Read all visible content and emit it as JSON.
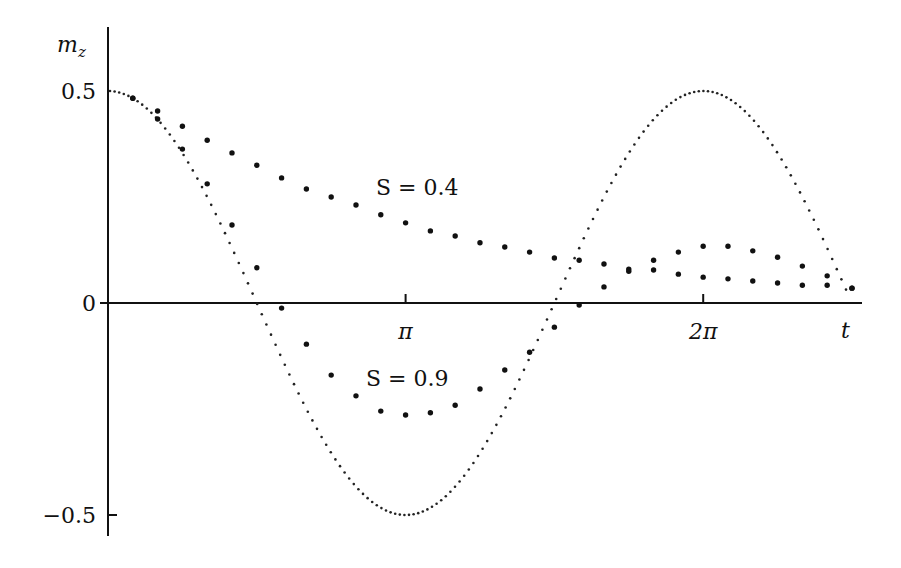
{
  "chart_data": {
    "type": "scatter",
    "title": "",
    "xlabel": "t",
    "ylabel": "m_z",
    "ylabel_main": "m",
    "ylabel_sub": "z",
    "x_ticks": [
      {
        "label": "π",
        "value_pi": 1
      },
      {
        "label": "2π",
        "value_pi": 2
      }
    ],
    "y_ticks": [
      {
        "label": "0.5",
        "value": 0.5
      },
      {
        "label": "0",
        "value": 0
      },
      {
        "label": "−0.5",
        "value": -0.5
      }
    ],
    "xlim_pi": [
      0,
      2.53
    ],
    "ylim": [
      -0.55,
      0.65
    ],
    "grid": false,
    "legend": "none (inline annotations)",
    "annotations": [
      {
        "text": "S = 0.4",
        "x_pi": 1.1,
        "y": 0.27
      },
      {
        "text": "S = 0.9",
        "x_pi": 1.0,
        "y": -0.18
      }
    ],
    "dt_pi": 0.08333,
    "series": [
      {
        "name": "reference 0.5·cos(t)",
        "style": "small dotted curve",
        "formula": "0.5*cos(t)",
        "t_range_pi": [
          0,
          2.48
        ]
      },
      {
        "name": "S = 0.4",
        "style": "large dots",
        "t_index": [
          1,
          2,
          3,
          4,
          5,
          6,
          7,
          8,
          9,
          10,
          11,
          12,
          13,
          14,
          15,
          16,
          17,
          18,
          19,
          20,
          21,
          22,
          23,
          24,
          25,
          26,
          27,
          28,
          29,
          30
        ],
        "values": [
          0.483,
          0.453,
          0.417,
          0.384,
          0.354,
          0.325,
          0.295,
          0.269,
          0.25,
          0.231,
          0.208,
          0.189,
          0.17,
          0.158,
          0.142,
          0.132,
          0.12,
          0.106,
          0.101,
          0.092,
          0.08,
          0.101,
          0.12,
          0.134,
          0.134,
          0.123,
          0.108,
          0.087,
          0.064,
          0.035
        ]
      },
      {
        "name": "S = 0.9",
        "style": "large dots",
        "t_index": [
          1,
          2,
          3,
          4,
          5,
          6,
          7,
          8,
          9,
          10,
          11,
          12,
          13,
          14,
          15,
          16,
          17,
          18,
          19,
          20,
          21,
          22,
          23,
          24,
          25,
          26,
          27,
          28,
          29,
          30
        ],
        "values": [
          0.483,
          0.434,
          0.363,
          0.281,
          0.184,
          0.083,
          -0.012,
          -0.097,
          -0.17,
          -0.219,
          -0.255,
          -0.264,
          -0.259,
          -0.241,
          -0.203,
          -0.158,
          -0.116,
          -0.057,
          -0.005,
          0.038,
          0.075,
          0.078,
          0.068,
          0.061,
          0.057,
          0.052,
          0.047,
          0.042,
          0.042,
          0.035
        ]
      }
    ]
  },
  "layout": {
    "origin_x": 108,
    "zero_y": 303,
    "px_per_pi": 297.6,
    "px_per_unit": 424,
    "axis_top": 27,
    "axis_bottom": 536,
    "axis_right": 862,
    "colors": {
      "ink": "#111111",
      "background": "#ffffff"
    }
  }
}
